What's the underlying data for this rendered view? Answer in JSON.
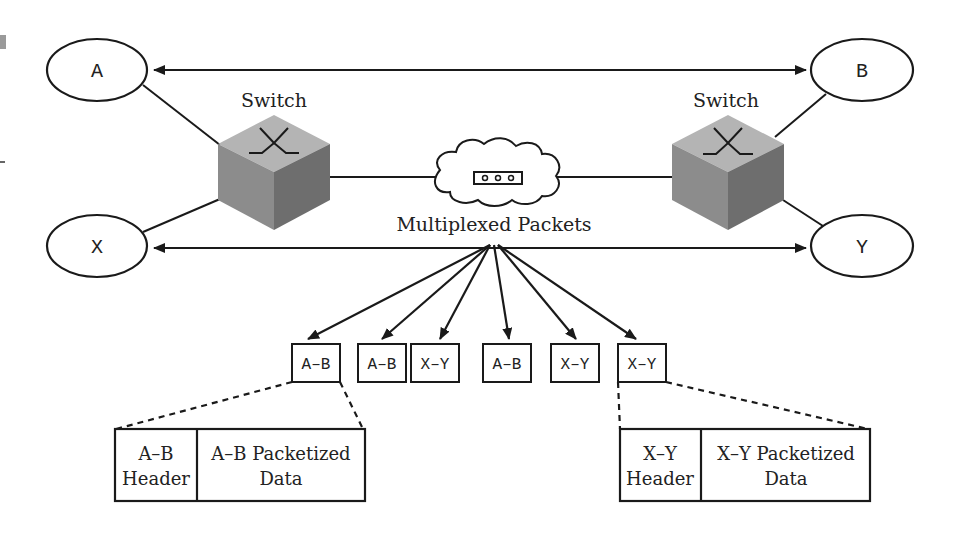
{
  "diagram": {
    "nodes": {
      "a": "A",
      "b": "B",
      "x": "X",
      "y": "Y"
    },
    "switch_left_label": "Switch",
    "switch_right_label": "Switch",
    "network_label": "Multiplexed Packets",
    "packets": [
      {
        "label": "A–B"
      },
      {
        "label": "A–B"
      },
      {
        "label": "X–Y"
      },
      {
        "label": "A–B"
      },
      {
        "label": "X–Y"
      },
      {
        "label": "X–Y"
      }
    ],
    "ab_detail": {
      "header_line1": "A–B",
      "header_line2": "Header",
      "data_line1": "A–B Packetized",
      "data_line2": "Data"
    },
    "xy_detail": {
      "header_line1": "X–Y",
      "header_line2": "Header",
      "data_line1": "X–Y Packetized",
      "data_line2": "Data"
    },
    "colors": {
      "line": "#1a1a1a",
      "cube_top": "#b4b4b4",
      "cube_left": "#8c8c8c",
      "cube_right": "#6e6e6e"
    }
  }
}
